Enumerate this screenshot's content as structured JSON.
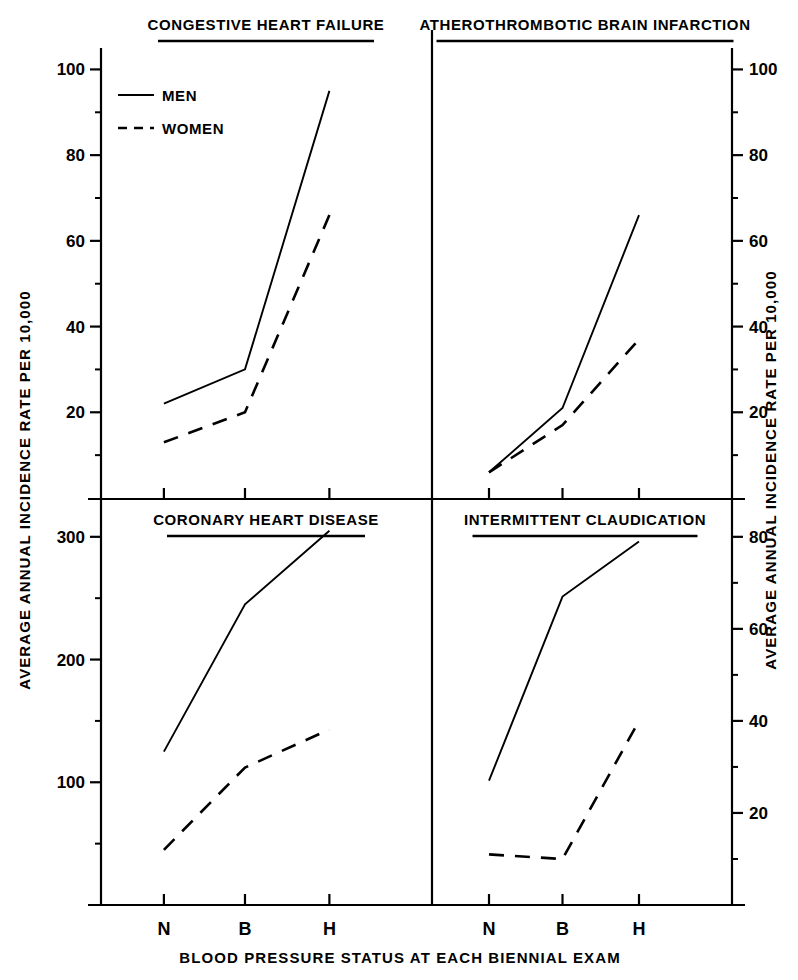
{
  "figure": {
    "xlabel": "BLOOD PRESSURE STATUS AT EACH BIENNIAL EXAM",
    "ylabel_left": "AVERAGE ANNUAL INCIDENCE RATE PER 10,000",
    "ylabel_right": "AVERAGE ANNUAL INCIDENCE RATE PER 10,000",
    "legend": {
      "men": "MEN",
      "women": "WOMEN"
    },
    "categories": [
      "N",
      "B",
      "H"
    ],
    "line_color": "#000000"
  },
  "chart_data": [
    {
      "type": "line",
      "title": "CONGESTIVE HEART FAILURE",
      "panel": "top-left",
      "xlabel": "BLOOD PRESSURE STATUS AT EACH BIENNIAL EXAM",
      "ylabel": "AVERAGE ANNUAL INCIDENCE RATE PER 10,000",
      "categories": [
        "N",
        "B",
        "H"
      ],
      "yticks": [
        20,
        40,
        60,
        80,
        100
      ],
      "ytick_labels": [
        "20",
        "40",
        "60",
        "80",
        "100"
      ],
      "ylim": [
        0,
        105
      ],
      "axis_side": "left",
      "grid": false,
      "legend_position": "top-left",
      "series": [
        {
          "name": "MEN",
          "style": "solid",
          "values": [
            22,
            30,
            95
          ]
        },
        {
          "name": "WOMEN",
          "style": "dashed",
          "values": [
            13,
            20,
            66
          ]
        }
      ]
    },
    {
      "type": "line",
      "title": "ATHEROTHROMBOTIC BRAIN INFARCTION",
      "panel": "top-right",
      "xlabel": "BLOOD PRESSURE STATUS AT EACH BIENNIAL EXAM",
      "ylabel": "AVERAGE ANNUAL INCIDENCE RATE PER 10,000",
      "categories": [
        "N",
        "B",
        "H"
      ],
      "yticks": [
        20,
        40,
        60,
        80,
        100
      ],
      "ytick_labels": [
        "20",
        "40",
        "60",
        "80",
        "100"
      ],
      "ylim": [
        0,
        105
      ],
      "axis_side": "right",
      "grid": false,
      "series": [
        {
          "name": "MEN",
          "style": "solid",
          "values": [
            6,
            21,
            66
          ]
        },
        {
          "name": "WOMEN",
          "style": "dashed",
          "values": [
            6,
            17,
            37
          ]
        }
      ]
    },
    {
      "type": "line",
      "title": "CORONARY HEART DISEASE",
      "panel": "bottom-left",
      "xlabel": "BLOOD PRESSURE STATUS AT EACH BIENNIAL EXAM",
      "ylabel": "AVERAGE ANNUAL INCIDENCE RATE PER 10,000",
      "categories": [
        "N",
        "B",
        "H"
      ],
      "yticks": [
        100,
        200,
        300
      ],
      "ytick_labels": [
        "100",
        "200",
        "300"
      ],
      "ylim": [
        0,
        330
      ],
      "axis_side": "left",
      "grid": false,
      "series": [
        {
          "name": "MEN",
          "style": "solid",
          "values": [
            125,
            245,
            305
          ]
        },
        {
          "name": "WOMEN",
          "style": "dashed",
          "values": [
            45,
            112,
            143
          ]
        }
      ]
    },
    {
      "type": "line",
      "title": "INTERMITTENT CLAUDICATION",
      "panel": "bottom-right",
      "xlabel": "BLOOD PRESSURE STATUS AT EACH BIENNIAL EXAM",
      "ylabel": "AVERAGE ANNUAL INCIDENCE RATE PER 10,000",
      "categories": [
        "N",
        "B",
        "H"
      ],
      "yticks": [
        20,
        40,
        60,
        80
      ],
      "ytick_labels": [
        "20",
        "40",
        "60",
        "80"
      ],
      "ylim": [
        0,
        88
      ],
      "axis_side": "right",
      "grid": false,
      "series": [
        {
          "name": "MEN",
          "style": "solid",
          "values": [
            27,
            67,
            79
          ]
        },
        {
          "name": "WOMEN",
          "style": "dashed",
          "values": [
            11,
            10,
            40
          ]
        }
      ]
    }
  ]
}
